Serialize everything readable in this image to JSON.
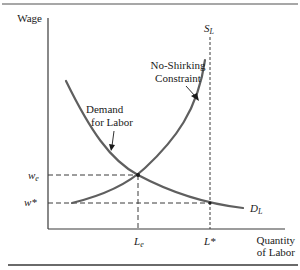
{
  "diagram": {
    "axes": {
      "y_label": "Wage",
      "x_label_line1": "Quantity",
      "x_label_line2": "of Labor"
    },
    "curves": {
      "demand_label_line1": "Demand",
      "demand_label_line2": "for Labor",
      "demand_end_label_main": "D",
      "demand_end_label_sub": "L",
      "nsc_label_line1": "No-Shirking",
      "nsc_label_line2": "Constraint",
      "supply_label_main": "S",
      "supply_label_sub": "L"
    },
    "ticks": {
      "w_e_main": "w",
      "w_e_sub": "e",
      "w_star": "w*",
      "L_e_main": "L",
      "L_e_sub": "e",
      "L_star": "L*"
    },
    "colors": {
      "curve": "#5f5f5f",
      "axis": "#3a3a3a",
      "text": "#1a1a1a",
      "background": "#ffffff"
    }
  }
}
